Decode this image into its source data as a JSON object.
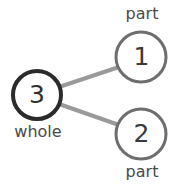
{
  "diagram": {
    "type": "number-bond",
    "background_color": "#ffffff",
    "nodes": [
      {
        "id": "whole",
        "value": "3",
        "label": "whole",
        "role": "whole",
        "stroke_color": "#2b2b2b",
        "stroke_width": 4,
        "fill_color": "#ffffff",
        "cx": 37,
        "cy": 95,
        "r": 24,
        "label_position": "below"
      },
      {
        "id": "part-1",
        "value": "1",
        "label": "part",
        "role": "part",
        "stroke_color": "#6e6e6e",
        "stroke_width": 3,
        "fill_color": "#ffffff",
        "cx": 141,
        "cy": 57,
        "r": 25,
        "label_position": "above"
      },
      {
        "id": "part-2",
        "value": "2",
        "label": "part",
        "role": "part",
        "stroke_color": "#6e6e6e",
        "stroke_width": 3,
        "fill_color": "#ffffff",
        "cx": 141,
        "cy": 134,
        "r": 25,
        "label_position": "below"
      }
    ],
    "connectors": [
      {
        "id": "connector-whole-part-1",
        "from": "whole",
        "to": "part-1",
        "x1": 59,
        "y1": 87,
        "x2": 119,
        "y2": 67,
        "stroke_color": "#9a9a9a",
        "stroke_width": 4
      },
      {
        "id": "connector-whole-part-2",
        "from": "whole",
        "to": "part-2",
        "x1": 59,
        "y1": 104,
        "x2": 119,
        "y2": 125,
        "stroke_color": "#9a9a9a",
        "stroke_width": 4
      }
    ]
  }
}
